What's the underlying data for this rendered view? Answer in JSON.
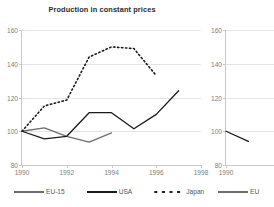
{
  "chart_data": {
    "type": "line",
    "title": "Production in constant prices",
    "xlabel": "",
    "ylabel": "",
    "xlim": [
      1990,
      1998
    ],
    "ylim": [
      80,
      160
    ],
    "xticks": [
      "1990",
      "1992",
      "1994",
      "1996",
      "1998"
    ],
    "yticks": [
      "80",
      "100",
      "120",
      "140",
      "160"
    ],
    "grid": true,
    "legend_position": "bottom",
    "series": [
      {
        "name": "EU-15",
        "style": "solid",
        "color": "#6e6e6e",
        "x": [
          1990,
          1991,
          1992,
          1993,
          1994
        ],
        "values": [
          100,
          102,
          97,
          93.5,
          99
        ]
      },
      {
        "name": "USA",
        "style": "solid",
        "color": "#1a1a1a",
        "x": [
          1990,
          1991,
          1992,
          1993,
          1994,
          1995,
          1996,
          1997
        ],
        "values": [
          100,
          95.5,
          97,
          111,
          111,
          101.5,
          110,
          124
        ]
      },
      {
        "name": "Japan",
        "style": "dotted",
        "color": "#1a1a1a",
        "x": [
          1990,
          1991,
          1992,
          1993,
          1994,
          1995,
          1996
        ],
        "values": [
          100,
          115,
          118.5,
          144,
          150,
          149,
          133
        ]
      }
    ]
  },
  "chart_next": {
    "type": "line",
    "title": "",
    "xticks": [
      "1990"
    ],
    "yticks": [
      "80",
      "100",
      "120",
      "140",
      "160"
    ],
    "ylim": [
      80,
      160
    ],
    "series": [
      {
        "name": "EU",
        "style": "solid",
        "color": "#1a1a1a",
        "x": [
          1990,
          1991
        ],
        "values": [
          100,
          94
        ]
      }
    ]
  },
  "legend": {
    "items": [
      {
        "label": "EU-15",
        "icon": "line-swatch-gray-solid"
      },
      {
        "label": "USA",
        "icon": "line-swatch-black-solid"
      },
      {
        "label": "Japan",
        "icon": "line-swatch-black-dotted"
      }
    ]
  },
  "legend_next": {
    "items": [
      {
        "label": "EU",
        "icon": "line-swatch-gray-solid"
      }
    ]
  }
}
